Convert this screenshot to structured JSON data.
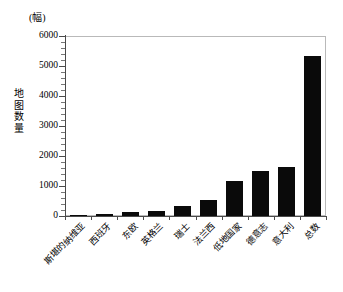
{
  "chart_data": {
    "type": "bar",
    "title": "",
    "subtitle": "",
    "unit_label": "(幅)",
    "ylabel": "地图数量",
    "xlabel": "",
    "categories": [
      "斯堪的纳维亚",
      "西班牙",
      "东欧",
      "英格兰",
      "瑞士",
      "法兰西",
      "低地国家",
      "德意志",
      "意大利",
      "总数"
    ],
    "values": [
      50,
      80,
      130,
      170,
      350,
      530,
      1180,
      1500,
      1650,
      5350
    ],
    "ylim": [
      0,
      6000
    ],
    "ytick_labels": [
      "0",
      "1000",
      "2000",
      "3000",
      "4000",
      "5000",
      "6000"
    ],
    "ytick_values": [
      0,
      1000,
      2000,
      3000,
      4000,
      5000,
      6000
    ],
    "yminor_step": 200,
    "grid": false,
    "legend": null,
    "bar_color": "#0a0a0a",
    "axis_color": "#4a4a4a"
  },
  "ylabel_chars": [
    "地",
    "图",
    "数",
    "量"
  ]
}
